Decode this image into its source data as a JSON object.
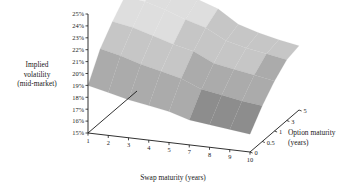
{
  "chart_data": {
    "type": "surface",
    "title": "",
    "xlabel": "Swap maturity (years)",
    "ylabel": "Implied volatility (mid-market)",
    "zlabel": "Option maturity (years)",
    "x_categories": [
      "1",
      "2",
      "3",
      "4",
      "5",
      "7",
      "8",
      "9",
      "10"
    ],
    "x_values": [
      1,
      2,
      3,
      4,
      5,
      7,
      8,
      9,
      10
    ],
    "z_categories": [
      "0",
      "0.5",
      "1",
      "3",
      "5"
    ],
    "z_values": [
      0,
      0.5,
      1,
      3,
      5
    ],
    "y_tick_labels": [
      "15%",
      "16%",
      "17%",
      "18%",
      "19%",
      "20%",
      "21%",
      "22%",
      "23%",
      "24%",
      "25%"
    ],
    "y_tick_values": [
      15,
      16,
      17,
      18,
      19,
      20,
      21,
      22,
      23,
      24,
      25
    ],
    "ylim": [
      15,
      25
    ],
    "grid": false,
    "legend": "none",
    "value_unit": "%",
    "series": [
      {
        "name": "0",
        "values": [
          19.0,
          18.6,
          18.2,
          17.9,
          17.6,
          17.1,
          16.9,
          16.7,
          16.5
        ]
      },
      {
        "name": "0.5",
        "values": [
          21.2,
          20.8,
          20.3,
          19.9,
          19.5,
          18.8,
          18.5,
          18.2,
          18.0
        ]
      },
      {
        "name": "1",
        "values": [
          22.6,
          22.3,
          21.8,
          21.3,
          20.9,
          20.1,
          19.8,
          19.5,
          19.2
        ]
      },
      {
        "name": "3",
        "values": [
          23.8,
          23.6,
          23.1,
          22.5,
          22.0,
          21.1,
          20.7,
          20.4,
          20.1
        ]
      },
      {
        "name": "5",
        "values": [
          24.2,
          24.5,
          24.0,
          23.3,
          22.7,
          21.6,
          21.1,
          20.7,
          20.4
        ]
      }
    ],
    "band_colors": [
      "#6f6f6f",
      "#8d8d8d",
      "#ababab",
      "#c6c6c6",
      "#dedede",
      "#efefef"
    ],
    "axis_color": "#1a1a1a",
    "background": "#ffffff"
  },
  "axes": {
    "y_title_lines": [
      "Implied",
      "volatility",
      "(mid-market)"
    ],
    "x_title": "Swap maturity (years)",
    "z_title_lines": [
      "Option maturity",
      "(years)"
    ]
  }
}
